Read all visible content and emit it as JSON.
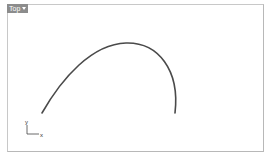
{
  "viewport": {
    "name": "Top",
    "tab_label": "Top",
    "dropdown_icon": "caret-down-icon"
  },
  "gizmo": {
    "x_label": "x",
    "y_label": "y",
    "colors": {
      "axis": "#444444"
    }
  },
  "curve": {
    "color": "#4a4a4a",
    "start": [
      42,
      113
    ],
    "peak": [
      125,
      43
    ],
    "end": [
      174,
      113
    ]
  },
  "colors": {
    "tab_bg": "#8c8c8c",
    "frame": "#c0c0c0",
    "background": "#ffffff"
  }
}
